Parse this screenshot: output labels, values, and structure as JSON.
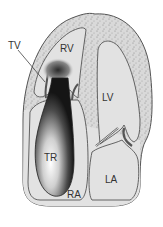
{
  "diagram": {
    "labels": {
      "tv": "TV",
      "rv": "RV",
      "lv": "LV",
      "tr": "TR",
      "ra": "RA",
      "la": "LA"
    },
    "colors": {
      "chamber_fill": "#e2e2e2",
      "myocardium_fill": "#d6d6d6",
      "outline": "#555555",
      "jet_dark": "#1a1a1a",
      "jet_light": "#ffffff",
      "background": "#ffffff"
    }
  }
}
